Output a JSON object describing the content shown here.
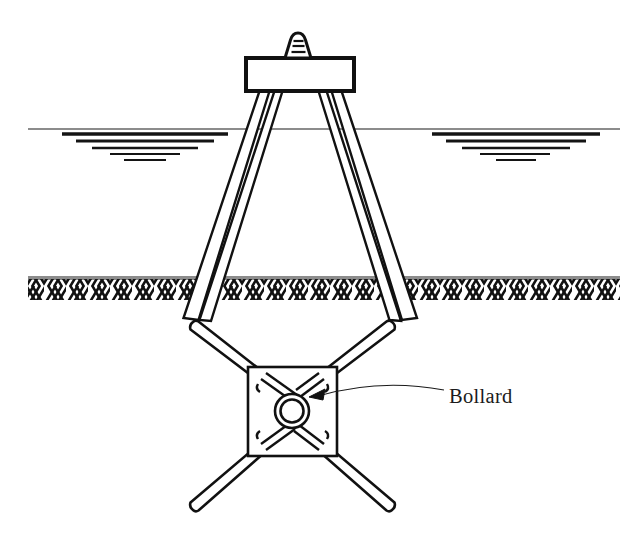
{
  "figure": {
    "background_color": "#ffffff",
    "ink_color": "#111111"
  },
  "annotations": [
    {
      "id": "bollard",
      "label": "Bollard",
      "target": "central ring of plan-view platform",
      "leader": "curved leader line with solid arrowhead",
      "label_x": 449,
      "label_y": 398,
      "arrow_tip_x": 316,
      "arrow_tip_y": 396
    }
  ],
  "views": {
    "elevation": {
      "name": "elevation-view",
      "description": "Deck block supported on four splayed piles passing through water into seabed",
      "deck": {
        "x": 246,
        "y": 58,
        "width": 108,
        "height": 33
      },
      "finial": {
        "name": "bollard-cap",
        "x": 290,
        "y": 33,
        "width": 22,
        "height": 25
      },
      "piles": [
        {
          "name": "pile-outer-left",
          "top_x": 262,
          "top_y": 91,
          "bottom_x": 186,
          "bottom_y": 318
        },
        {
          "name": "pile-inner-left",
          "top_x": 276,
          "top_y": 91,
          "bottom_x": 200,
          "bottom_y": 318
        },
        {
          "name": "pile-inner-right",
          "top_x": 324,
          "top_y": 91,
          "bottom_x": 400,
          "bottom_y": 318
        },
        {
          "name": "pile-outer-right",
          "top_x": 338,
          "top_y": 91,
          "bottom_x": 414,
          "bottom_y": 318
        }
      ],
      "waterline": {
        "name": "waterline",
        "y": 129,
        "x_start": 28,
        "x_end": 620
      },
      "water_marks": [
        {
          "side": "left",
          "center_x": 140,
          "top_y": 136,
          "rows": 5
        },
        {
          "side": "right",
          "center_x": 512,
          "top_y": 136,
          "rows": 5
        }
      ],
      "seabed": {
        "name": "seabed-line",
        "y": 277,
        "x_start": 28,
        "x_end": 620,
        "hatch_depth": 22
      }
    },
    "plan": {
      "name": "plan-view",
      "description": "Square platform in plan with four diagonal raking piles and central bollard ring",
      "platform": {
        "x": 248,
        "y": 367,
        "width": 89,
        "height": 89
      },
      "bollard_ring": {
        "cx": 292,
        "cy": 411,
        "outer_radius": 17,
        "inner_radius": 11
      },
      "raking_piles": [
        {
          "name": "raking-pile-top-left",
          "inner_x": 262,
          "inner_y": 383,
          "outer_x": 190,
          "outer_y": 327
        },
        {
          "name": "raking-pile-top-right",
          "inner_x": 323,
          "inner_y": 383,
          "outer_x": 395,
          "outer_y": 327
        },
        {
          "name": "raking-pile-bottom-left",
          "inner_x": 262,
          "inner_y": 440,
          "outer_x": 190,
          "outer_y": 508
        },
        {
          "name": "raking-pile-bottom-right",
          "inner_x": 323,
          "inner_y": 440,
          "outer_x": 395,
          "outer_y": 508
        }
      ]
    }
  }
}
